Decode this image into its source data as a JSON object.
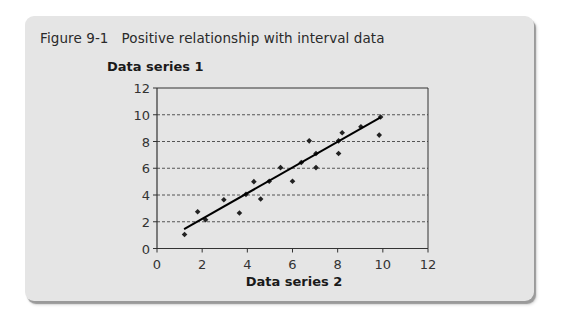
{
  "figure": {
    "number": "Figure 9-1",
    "caption": "Positive relationship with interval data"
  },
  "colors": {
    "panel_bg": "#e5e5e5",
    "axis": "#333333",
    "gridline": "#555555",
    "points": "#222222",
    "trendline": "#000000"
  },
  "chart_data": {
    "type": "scatter",
    "xlabel": "Data series 2",
    "ylabel": "Data series 1",
    "xlim": [
      0,
      12
    ],
    "ylim": [
      0,
      12
    ],
    "x_ticks": [
      0,
      2,
      4,
      6,
      8,
      10,
      12
    ],
    "y_ticks": [
      0,
      2,
      4,
      6,
      8,
      10,
      12
    ],
    "grid": "horizontal dashed",
    "legend": "none",
    "series": [
      {
        "name": "Data series 1 vs Data series 2",
        "points": [
          [
            1.22,
            1.05
          ],
          [
            1.8,
            2.75
          ],
          [
            2.15,
            2.15
          ],
          [
            2.96,
            3.65
          ],
          [
            3.65,
            2.65
          ],
          [
            3.94,
            4.05
          ],
          [
            4.29,
            5.0
          ],
          [
            4.59,
            3.7
          ],
          [
            4.97,
            5.03
          ],
          [
            5.47,
            6.05
          ],
          [
            6.0,
            5.03
          ],
          [
            6.39,
            6.43
          ],
          [
            6.74,
            8.05
          ],
          [
            7.04,
            7.1
          ],
          [
            7.04,
            6.05
          ],
          [
            8.04,
            8.05
          ],
          [
            8.04,
            7.1
          ],
          [
            8.2,
            8.65
          ],
          [
            9.03,
            9.1
          ],
          [
            9.84,
            8.48
          ],
          [
            9.9,
            9.83
          ]
        ]
      }
    ],
    "trendline": {
      "type": "linear",
      "start": [
        1.2,
        1.45
      ],
      "end": [
        9.9,
        9.8
      ]
    }
  }
}
